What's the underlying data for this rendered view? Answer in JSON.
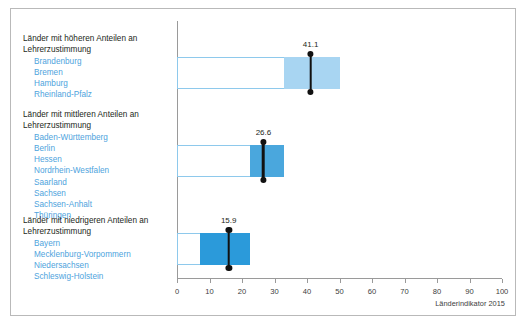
{
  "source_note": "Länderindikator 2015",
  "groups": [
    {
      "title": "Länder mit höheren Anteilen an Lehrerzustimmung",
      "members": [
        "Brandenburg",
        "Bremen",
        "Hamburg",
        "Rheinland-Pfalz"
      ],
      "value_label": "41.1"
    },
    {
      "title": "Länder mit mittleren Anteilen an Lehrerzustimmung",
      "members": [
        "Baden-Württemberg",
        "Berlin",
        "Hessen",
        "Nordrhein-Westfalen",
        "Saarland",
        "Sachsen",
        "Sachsen-Anhalt",
        "Thüringen"
      ],
      "value_label": "26.6"
    },
    {
      "title": "Länder mit niedrigeren Anteilen an Lehrerzustimmung",
      "members": [
        "Bayern",
        "Mecklenburg-Vorpommern",
        "Niedersachsen",
        "Schleswig-Holstein"
      ],
      "value_label": "15.9"
    }
  ],
  "colors": {
    "bar_outline": "#8ec9ec",
    "fill_high": "#a8d5f2",
    "fill_mid": "#4aa7dd",
    "fill_low": "#2b9ada",
    "marker": "#111111",
    "member_text": "#4ea3dd",
    "axis": "#9a9a9a",
    "frame": "#b9b9b9"
  },
  "chart_data": {
    "type": "bar",
    "title": "",
    "xlabel": "",
    "ylabel": "",
    "xlim": [
      0,
      100
    ],
    "grid": false,
    "legend": "none",
    "ticks": [
      0,
      10,
      20,
      30,
      40,
      50,
      60,
      70,
      80,
      90,
      100
    ],
    "tick_labels": [
      "0",
      "10",
      "20",
      "30",
      "40",
      "50",
      "60",
      "70",
      "80",
      "90",
      "100"
    ],
    "categories": [
      "Länder mit höheren Anteilen an Lehrerzustimmung",
      "Länder mit mittleren Anteilen an Lehrerzustimmung",
      "Länder mit niedrigeren Anteilen an Lehrerzustimmung"
    ],
    "values": [
      41.1,
      26.6,
      15.9
    ],
    "bars": [
      {
        "category": "Länder mit höheren Anteilen an Lehrerzustimmung",
        "value": 41.1,
        "value_label": "41.1",
        "outline_start": 0,
        "outline_end": 50.0,
        "fill_start": 33.0,
        "fill_end": 50.0,
        "fill_color": "#a8d5f2"
      },
      {
        "category": "Länder mit mittleren Anteilen an Lehrerzustimmung",
        "value": 26.6,
        "value_label": "26.6",
        "outline_start": 0,
        "outline_end": 33.0,
        "fill_start": 22.5,
        "fill_end": 33.0,
        "fill_color": "#4aa7dd"
      },
      {
        "category": "Länder mit niedrigeren Anteilen an Lehrerzustimmung",
        "value": 15.9,
        "value_label": "15.9",
        "outline_start": 0,
        "outline_end": 22.5,
        "fill_start": 7.0,
        "fill_end": 22.5,
        "fill_color": "#2b9ada"
      }
    ]
  }
}
